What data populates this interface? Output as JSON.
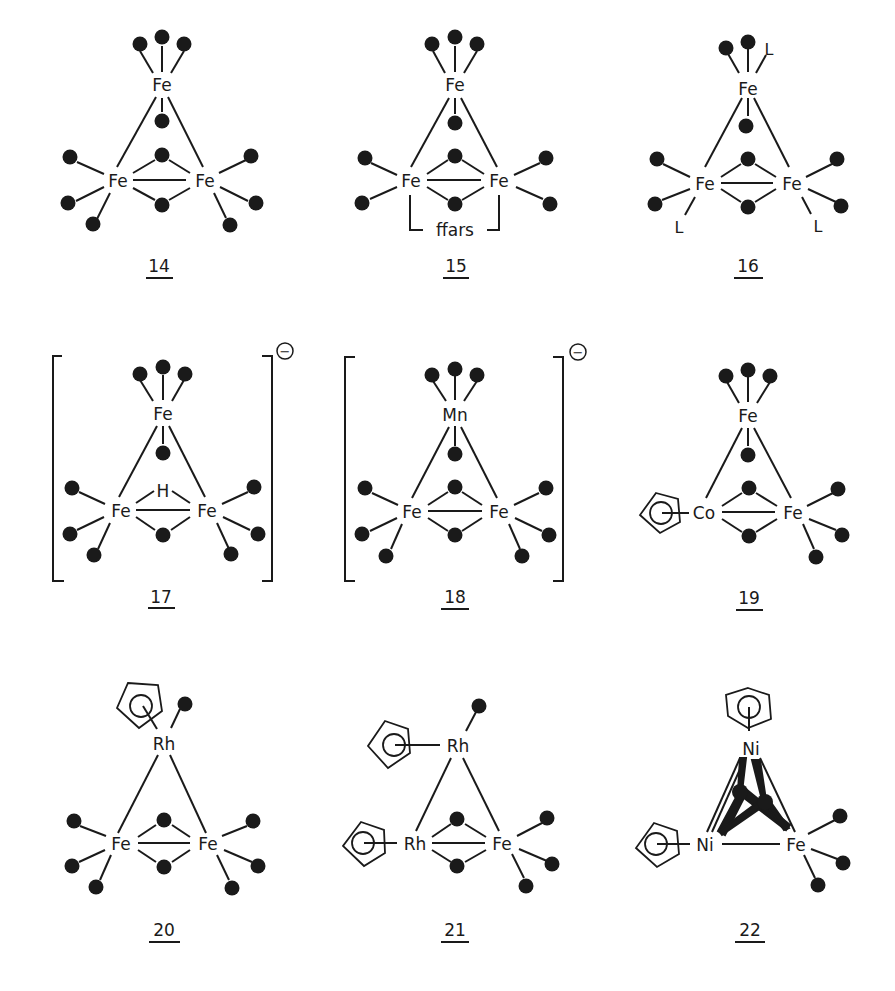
{
  "figure": {
    "colors": {
      "ink": "#1a1a1a",
      "background": "#ffffff"
    },
    "structures": [
      {
        "id": "14",
        "label": "14",
        "col": 0,
        "row": 0,
        "top": {
          "atom": "Fe",
          "ligands": [
            "CO",
            "CO",
            "CO"
          ],
          "bridgeCO": true
        },
        "left": {
          "atom": "Fe",
          "ligands": [
            "CO",
            "CO",
            "CO"
          ]
        },
        "right": {
          "atom": "Fe",
          "ligands": [
            "CO",
            "CO",
            "CO"
          ]
        },
        "bridges": [
          "CO",
          "CO"
        ],
        "bracket": false,
        "charge": ""
      },
      {
        "id": "15",
        "label": "15",
        "col": 1,
        "row": 0,
        "top": {
          "atom": "Fe",
          "ligands": [
            "CO",
            "CO",
            "CO"
          ],
          "bridgeCO": true
        },
        "left": {
          "atom": "Fe",
          "ligands": [
            "CO",
            "CO"
          ]
        },
        "right": {
          "atom": "Fe",
          "ligands": [
            "CO",
            "CO"
          ]
        },
        "bridges": [
          "CO",
          "CO"
        ],
        "chelate": "ffars",
        "bracket": false,
        "charge": ""
      },
      {
        "id": "16",
        "label": "16",
        "col": 2,
        "row": 0,
        "top": {
          "atom": "Fe",
          "ligands": [
            "CO",
            "CO",
            "L"
          ],
          "bridgeCO": true
        },
        "left": {
          "atom": "Fe",
          "ligands": [
            "CO",
            "CO",
            "L"
          ]
        },
        "right": {
          "atom": "Fe",
          "ligands": [
            "CO",
            "CO",
            "L"
          ]
        },
        "bridges": [
          "CO",
          "CO"
        ],
        "bracket": false,
        "charge": "",
        "ligandLabel": "L"
      },
      {
        "id": "17",
        "label": "17",
        "col": 0,
        "row": 1,
        "top": {
          "atom": "Fe",
          "ligands": [
            "CO",
            "CO",
            "CO"
          ],
          "bridgeCO": true
        },
        "left": {
          "atom": "Fe",
          "ligands": [
            "CO",
            "CO",
            "CO"
          ]
        },
        "right": {
          "atom": "Fe",
          "ligands": [
            "CO",
            "CO",
            "CO"
          ]
        },
        "bridges": [
          "H",
          "CO"
        ],
        "hydride": "H",
        "bracket": true,
        "charge": "−"
      },
      {
        "id": "18",
        "label": "18",
        "col": 1,
        "row": 1,
        "top": {
          "atom": "Mn",
          "ligands": [
            "CO",
            "CO",
            "CO"
          ],
          "bridgeCO": true
        },
        "left": {
          "atom": "Fe",
          "ligands": [
            "CO",
            "CO",
            "CO"
          ]
        },
        "right": {
          "atom": "Fe",
          "ligands": [
            "CO",
            "CO",
            "CO"
          ]
        },
        "bridges": [
          "CO",
          "CO"
        ],
        "bracket": true,
        "charge": "−"
      },
      {
        "id": "19",
        "label": "19",
        "col": 2,
        "row": 1,
        "top": {
          "atom": "Fe",
          "ligands": [
            "CO",
            "CO",
            "CO"
          ],
          "bridgeCO": true
        },
        "left": {
          "atom": "Co",
          "ligands": [
            "Cp"
          ]
        },
        "right": {
          "atom": "Fe",
          "ligands": [
            "CO",
            "CO",
            "CO"
          ]
        },
        "bridges": [
          "CO",
          "CO"
        ],
        "bracket": false,
        "charge": ""
      },
      {
        "id": "20",
        "label": "20",
        "col": 0,
        "row": 2,
        "top": {
          "atom": "Rh",
          "ligands": [
            "Cp",
            "CO"
          ],
          "bridgeCO": false
        },
        "left": {
          "atom": "Fe",
          "ligands": [
            "CO",
            "CO",
            "CO"
          ]
        },
        "right": {
          "atom": "Fe",
          "ligands": [
            "CO",
            "CO",
            "CO"
          ]
        },
        "bridges": [
          "CO",
          "CO"
        ],
        "bracket": false,
        "charge": ""
      },
      {
        "id": "21",
        "label": "21",
        "col": 1,
        "row": 2,
        "top": {
          "atom": "Rh",
          "ligands": [
            "Cp",
            "CO"
          ],
          "bridgeCO": false
        },
        "left": {
          "atom": "Rh",
          "ligands": [
            "Cp"
          ]
        },
        "right": {
          "atom": "Fe",
          "ligands": [
            "CO",
            "CO",
            "CO"
          ]
        },
        "bridges": [
          "CO",
          "CO"
        ],
        "bracket": false,
        "charge": ""
      },
      {
        "id": "22",
        "label": "22",
        "col": 2,
        "row": 2,
        "top": {
          "atom": "Ni",
          "ligands": [
            "Cp"
          ],
          "bridgeCO": false
        },
        "left": {
          "atom": "Ni",
          "ligands": [
            "Cp"
          ]
        },
        "right": {
          "atom": "Fe",
          "ligands": [
            "CO",
            "CO",
            "CO"
          ]
        },
        "bridges": [
          "mu3-CO",
          "mu3-CO"
        ],
        "bracket": false,
        "charge": ""
      }
    ]
  }
}
